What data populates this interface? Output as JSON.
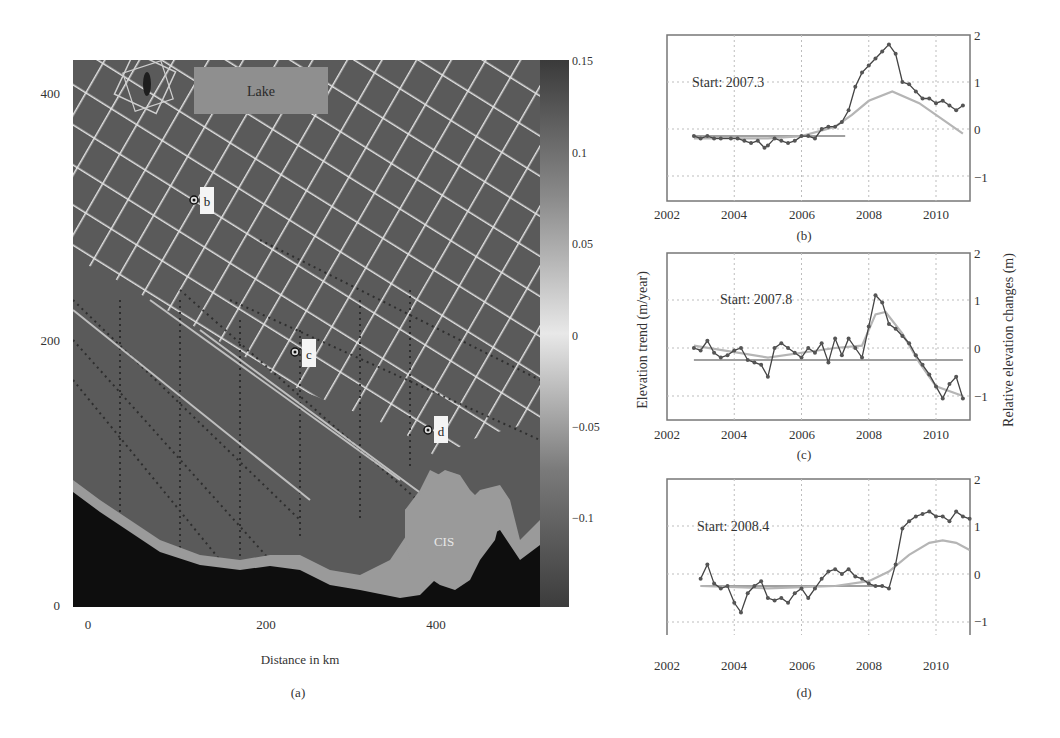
{
  "figure": {
    "panels": [
      "(a)",
      "(b)",
      "(c)",
      "(d)"
    ]
  },
  "map": {
    "caption": "(a)",
    "xlabel": "Distance in km",
    "x_ticks": [
      "0",
      "200",
      "400"
    ],
    "y_ticks": [
      "0",
      "200",
      "400"
    ],
    "labels": {
      "lake": "Lake",
      "cis": "CIS",
      "b": "b",
      "c": "c",
      "d": "d"
    },
    "colorbar": {
      "ticks": [
        "0.15",
        "0.1",
        "0.05",
        "0",
        "−0.05",
        "−0.1"
      ],
      "range": [
        -0.15,
        0.15
      ]
    },
    "colors": {
      "land": "#5a5a5a",
      "grid_tracks": "#e6e6e6",
      "ocean": "#0e0e0e",
      "shelf": "#9a9a9a",
      "lake": "#8f8f8f"
    }
  },
  "shared_axes": {
    "left_ylabel": "Elevation trend (m/year)",
    "right_ylabel": "Relative elevation changes (m)",
    "x_ticks": [
      "2002",
      "2004",
      "2006",
      "2008",
      "2010"
    ],
    "y_ticks": [
      "2",
      "1",
      "0",
      "−1"
    ]
  },
  "chart_data": [
    {
      "panel": "(b)",
      "type": "line",
      "annotation": "Start: 2007.3",
      "xlabel": "",
      "ylabel": "Relative elevation changes (m)",
      "xlim": [
        2002,
        2011
      ],
      "ylim": [
        -1.5,
        2
      ],
      "grid": true,
      "series": [
        {
          "name": "observed",
          "x": [
            2002.8,
            2003.0,
            2003.2,
            2003.4,
            2003.6,
            2003.9,
            2004.1,
            2004.3,
            2004.5,
            2004.7,
            2004.9,
            2005.0,
            2005.2,
            2005.4,
            2005.6,
            2005.8,
            2006.0,
            2006.2,
            2006.4,
            2006.6,
            2006.8,
            2007.0,
            2007.2,
            2007.4,
            2007.6,
            2007.8,
            2008.0,
            2008.2,
            2008.4,
            2008.6,
            2008.8,
            2009.0,
            2009.2,
            2009.4,
            2009.6,
            2009.8,
            2010.0,
            2010.2,
            2010.4,
            2010.6,
            2010.8
          ],
          "values": [
            -0.15,
            -0.2,
            -0.15,
            -0.2,
            -0.2,
            -0.2,
            -0.2,
            -0.25,
            -0.3,
            -0.25,
            -0.4,
            -0.35,
            -0.2,
            -0.25,
            -0.3,
            -0.25,
            -0.15,
            -0.15,
            -0.2,
            0.0,
            0.05,
            0.05,
            0.15,
            0.4,
            0.9,
            1.2,
            1.35,
            1.5,
            1.65,
            1.8,
            1.6,
            1.0,
            0.95,
            0.8,
            0.65,
            0.65,
            0.55,
            0.6,
            0.5,
            0.4,
            0.5
          ]
        },
        {
          "name": "model fit",
          "x": [
            2002.8,
            2004,
            2005,
            2006,
            2007,
            2007.5,
            2008,
            2008.7,
            2009.5,
            2010,
            2010.8
          ],
          "values": [
            -0.2,
            -0.2,
            -0.2,
            -0.15,
            0.05,
            0.3,
            0.6,
            0.8,
            0.55,
            0.3,
            -0.1
          ]
        },
        {
          "name": "trend",
          "x": [
            2002.8,
            2007.3
          ],
          "values": [
            -0.15,
            -0.15
          ]
        }
      ]
    },
    {
      "panel": "(c)",
      "type": "line",
      "annotation": "Start: 2007.8",
      "xlabel": "",
      "ylabel": "Elevation trend (m/year)",
      "xlim": [
        2002,
        2011
      ],
      "ylim": [
        -1.5,
        2
      ],
      "grid": true,
      "series": [
        {
          "name": "observed",
          "x": [
            2002.8,
            2003.0,
            2003.2,
            2003.4,
            2003.6,
            2003.8,
            2004.0,
            2004.2,
            2004.4,
            2004.6,
            2004.8,
            2005.0,
            2005.2,
            2005.4,
            2005.6,
            2005.8,
            2006.0,
            2006.2,
            2006.4,
            2006.6,
            2006.8,
            2007.0,
            2007.2,
            2007.4,
            2007.6,
            2007.8,
            2008.0,
            2008.2,
            2008.4,
            2008.6,
            2008.8,
            2009.0,
            2009.2,
            2009.4,
            2009.6,
            2009.8,
            2010.0,
            2010.2,
            2010.4,
            2010.6,
            2010.8
          ],
          "values": [
            0.0,
            -0.05,
            0.15,
            -0.1,
            -0.2,
            -0.15,
            -0.05,
            0.0,
            -0.25,
            -0.3,
            -0.35,
            -0.6,
            0.0,
            0.1,
            0.0,
            -0.1,
            -0.2,
            0.0,
            -0.1,
            0.1,
            -0.3,
            0.2,
            -0.15,
            0.2,
            0.0,
            -0.2,
            0.45,
            1.1,
            0.95,
            0.5,
            0.4,
            0.25,
            0.1,
            -0.15,
            -0.35,
            -0.55,
            -0.8,
            -1.05,
            -0.75,
            -0.6,
            -1.05
          ]
        },
        {
          "name": "model fit",
          "x": [
            2002.8,
            2005,
            2007,
            2007.8,
            2008.2,
            2008.5,
            2009,
            2009.5,
            2010,
            2010.8
          ],
          "values": [
            0.05,
            -0.2,
            0.0,
            0.05,
            0.7,
            0.75,
            0.3,
            -0.3,
            -0.8,
            -1.0
          ]
        },
        {
          "name": "trend",
          "x": [
            2002.8,
            2010.8
          ],
          "values": [
            -0.25,
            -0.25
          ]
        }
      ]
    },
    {
      "panel": "(d)",
      "type": "line",
      "annotation": "Start: 2008.4",
      "xlabel": "",
      "ylabel": "Relative elevation changes (m)",
      "xlim": [
        2002,
        2011
      ],
      "ylim": [
        -1.3,
        2
      ],
      "grid": true,
      "series": [
        {
          "name": "observed",
          "x": [
            2003.0,
            2003.2,
            2003.4,
            2003.6,
            2003.8,
            2004.0,
            2004.2,
            2004.4,
            2004.6,
            2004.8,
            2005.0,
            2005.2,
            2005.4,
            2005.6,
            2005.8,
            2006.0,
            2006.2,
            2006.4,
            2006.6,
            2006.8,
            2007.0,
            2007.2,
            2007.4,
            2007.6,
            2007.8,
            2008.0,
            2008.2,
            2008.4,
            2008.6,
            2008.8,
            2009.0,
            2009.2,
            2009.4,
            2009.6,
            2009.8,
            2010.0,
            2010.2,
            2010.4,
            2010.6,
            2010.8,
            2011.0
          ],
          "values": [
            -0.1,
            0.2,
            -0.2,
            -0.3,
            -0.25,
            -0.6,
            -0.8,
            -0.4,
            -0.25,
            -0.15,
            -0.5,
            -0.55,
            -0.5,
            -0.6,
            -0.4,
            -0.3,
            -0.5,
            -0.3,
            -0.1,
            0.05,
            0.1,
            0.0,
            0.1,
            -0.05,
            -0.1,
            -0.2,
            -0.25,
            -0.25,
            -0.3,
            0.2,
            0.95,
            1.1,
            1.2,
            1.25,
            1.3,
            1.2,
            1.2,
            1.1,
            1.3,
            1.2,
            1.15
          ]
        },
        {
          "name": "model fit",
          "x": [
            2003,
            2005,
            2007,
            2008,
            2008.6,
            2009.2,
            2009.8,
            2010.2,
            2010.6,
            2011
          ],
          "values": [
            -0.25,
            -0.3,
            -0.25,
            -0.15,
            0.05,
            0.4,
            0.65,
            0.7,
            0.65,
            0.5
          ]
        },
        {
          "name": "trend",
          "x": [
            2003,
            2008.4
          ],
          "values": [
            -0.25,
            -0.25
          ]
        }
      ]
    }
  ]
}
